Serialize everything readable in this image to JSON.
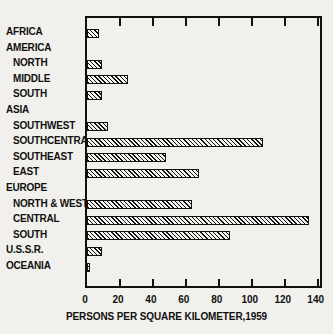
{
  "chart_data": {
    "type": "bar",
    "orientation": "horizontal",
    "title": "",
    "xlabel": "PERSONS PER SQUARE KILOMETER,1959",
    "ylabel": "",
    "xlim": [
      0,
      142
    ],
    "xticks": [
      0,
      20,
      40,
      60,
      80,
      100,
      120,
      140
    ],
    "xticklabels": [
      "0",
      "20",
      "40",
      "60",
      "80",
      "100",
      "120",
      "140"
    ],
    "grid": false,
    "legend": null,
    "categories": [
      "AFRICA",
      "AMERICA",
      "NORTH",
      "MIDDLE",
      "SOUTH",
      "ASIA",
      "SOUTHWEST",
      "SOUTHCENTRAL",
      "SOUTHEAST",
      "EAST",
      "EUROPE",
      "NORTH & WEST",
      "CENTRAL",
      "SOUTH",
      "U.S.S.R.",
      "OCEANIA"
    ],
    "values": [
      7,
      null,
      9,
      25,
      9,
      null,
      13,
      107,
      48,
      68,
      null,
      64,
      135,
      87,
      9,
      2
    ],
    "rows": [
      {
        "label": "AFRICA",
        "level": "group",
        "value": 7
      },
      {
        "label": "AMERICA",
        "level": "group",
        "value": null
      },
      {
        "label": "NORTH",
        "level": "sub",
        "value": 9
      },
      {
        "label": "MIDDLE",
        "level": "sub",
        "value": 25
      },
      {
        "label": "SOUTH",
        "level": "sub",
        "value": 9
      },
      {
        "label": "ASIA",
        "level": "group",
        "value": null
      },
      {
        "label": "SOUTHWEST",
        "level": "sub",
        "value": 13
      },
      {
        "label": "SOUTHCENTRAL",
        "level": "sub",
        "value": 107
      },
      {
        "label": "SOUTHEAST",
        "level": "sub",
        "value": 48
      },
      {
        "label": "EAST",
        "level": "sub",
        "value": 68
      },
      {
        "label": "EUROPE",
        "level": "group",
        "value": null
      },
      {
        "label": "NORTH & WEST",
        "level": "sub",
        "value": 64
      },
      {
        "label": "CENTRAL",
        "level": "sub",
        "value": 135
      },
      {
        "label": "SOUTH",
        "level": "sub",
        "value": 87
      },
      {
        "label": "U.S.S.R.",
        "level": "solo",
        "value": 9
      },
      {
        "label": "OCEANIA",
        "level": "solo",
        "value": 2
      }
    ],
    "colors": {
      "background": "#f2f0ec",
      "ink": "#111111",
      "bar_fill": "#e9e7e3",
      "bar_hatch": "#111111"
    }
  },
  "figure": {
    "axis_caption": "PERSONS PER SQUARE KILOMETER,1959"
  }
}
